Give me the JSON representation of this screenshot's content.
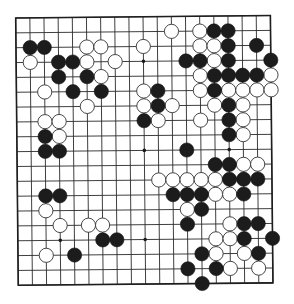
{
  "board": {
    "size": 19,
    "colors": {
      "background": "#ffffff",
      "line": "#2a2a2a",
      "black_stone": "#1c1c1c",
      "white_stone": "#ffffff"
    },
    "star_points": [
      [
        3,
        3
      ],
      [
        3,
        9
      ],
      [
        3,
        15
      ],
      [
        9,
        3
      ],
      [
        9,
        9
      ],
      [
        9,
        15
      ],
      [
        15,
        3
      ],
      [
        15,
        9
      ],
      [
        15,
        15
      ]
    ],
    "black_stones": [
      [
        2,
        1
      ],
      [
        2,
        2
      ],
      [
        3,
        3
      ],
      [
        3,
        4
      ],
      [
        4,
        3
      ],
      [
        4,
        5
      ],
      [
        5,
        4
      ],
      [
        5,
        6
      ],
      [
        7,
        9
      ],
      [
        8,
        2
      ],
      [
        9,
        2
      ],
      [
        9,
        3
      ],
      [
        12,
        2
      ],
      [
        12,
        3
      ],
      [
        15,
        6
      ],
      [
        15,
        7
      ],
      [
        16,
        4
      ],
      [
        1,
        14
      ],
      [
        1,
        15
      ],
      [
        2,
        15
      ],
      [
        2,
        17
      ],
      [
        3,
        12
      ],
      [
        3,
        13
      ],
      [
        3,
        15
      ],
      [
        3,
        18
      ],
      [
        4,
        14
      ],
      [
        4,
        15
      ],
      [
        4,
        16
      ],
      [
        4,
        17
      ],
      [
        5,
        10
      ],
      [
        5,
        14
      ],
      [
        6,
        10
      ],
      [
        6,
        15
      ],
      [
        7,
        15
      ],
      [
        8,
        15
      ],
      [
        9,
        12
      ],
      [
        10,
        14
      ],
      [
        10,
        15
      ],
      [
        11,
        15
      ],
      [
        11,
        16
      ],
      [
        11,
        17
      ],
      [
        12,
        11
      ],
      [
        12,
        12
      ],
      [
        12,
        13
      ],
      [
        12,
        16
      ],
      [
        13,
        13
      ],
      [
        14,
        12
      ],
      [
        14,
        16
      ],
      [
        14,
        17
      ],
      [
        15,
        16
      ],
      [
        15,
        18
      ],
      [
        16,
        13
      ],
      [
        16,
        17
      ],
      [
        17,
        12
      ],
      [
        17,
        14
      ],
      [
        18,
        13
      ]
    ],
    "white_stones": [
      [
        2,
        5
      ],
      [
        2,
        6
      ],
      [
        2,
        9
      ],
      [
        3,
        1
      ],
      [
        3,
        5
      ],
      [
        3,
        7
      ],
      [
        4,
        6
      ],
      [
        5,
        2
      ],
      [
        5,
        9
      ],
      [
        6,
        5
      ],
      [
        6,
        9
      ],
      [
        7,
        2
      ],
      [
        7,
        3
      ],
      [
        7,
        10
      ],
      [
        8,
        3
      ],
      [
        13,
        2
      ],
      [
        14,
        3
      ],
      [
        14,
        5
      ],
      [
        14,
        6
      ],
      [
        16,
        2
      ],
      [
        1,
        11
      ],
      [
        1,
        13
      ],
      [
        2,
        13
      ],
      [
        2,
        14
      ],
      [
        3,
        14
      ],
      [
        4,
        13
      ],
      [
        4,
        18
      ],
      [
        5,
        13
      ],
      [
        5,
        15
      ],
      [
        5,
        16
      ],
      [
        5,
        17
      ],
      [
        5,
        18
      ],
      [
        6,
        11
      ],
      [
        6,
        14
      ],
      [
        6,
        16
      ],
      [
        7,
        13
      ],
      [
        7,
        16
      ],
      [
        8,
        16
      ],
      [
        10,
        16
      ],
      [
        10,
        17
      ],
      [
        11,
        10
      ],
      [
        11,
        11
      ],
      [
        11,
        12
      ],
      [
        11,
        13
      ],
      [
        11,
        14
      ],
      [
        12,
        14
      ],
      [
        12,
        15
      ],
      [
        13,
        12
      ],
      [
        14,
        15
      ],
      [
        15,
        14
      ],
      [
        15,
        15
      ],
      [
        16,
        14
      ],
      [
        16,
        16
      ],
      [
        17,
        15
      ],
      [
        17,
        17
      ]
    ]
  }
}
